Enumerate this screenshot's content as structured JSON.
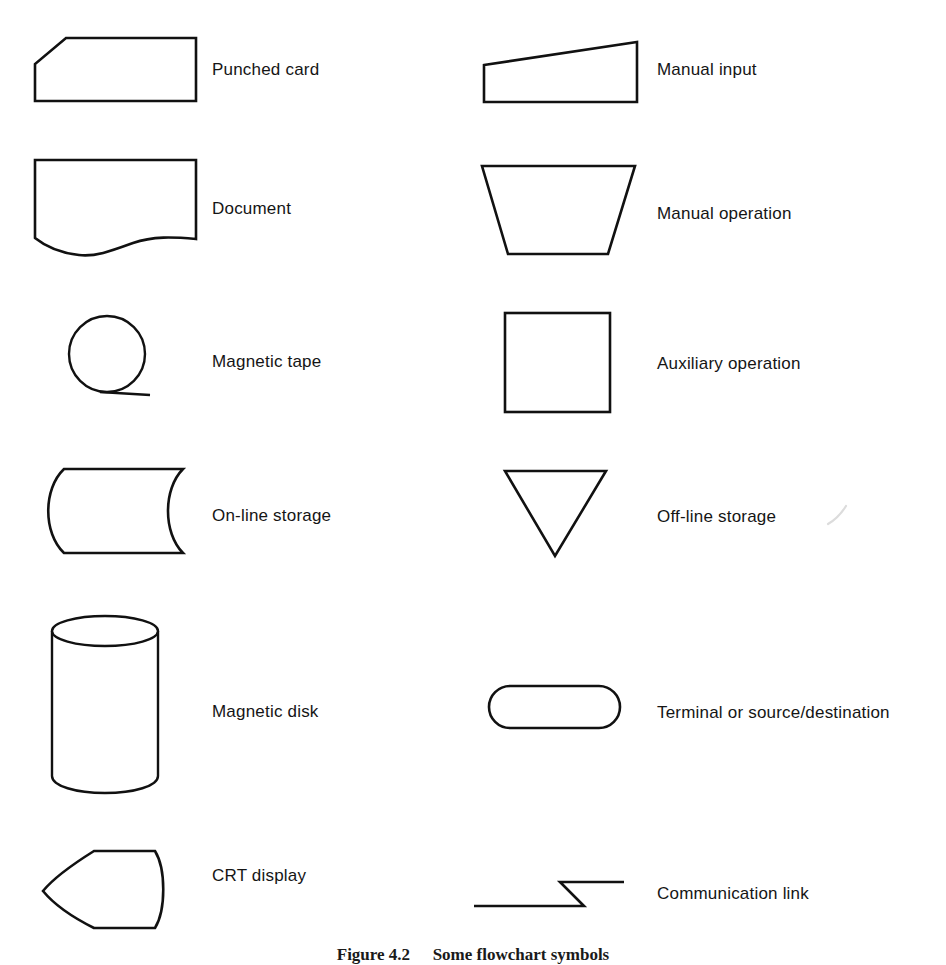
{
  "figure": {
    "caption_title": "Figure 4.2",
    "caption_rest": "Some flowchart symbols",
    "background_color": "#ffffff",
    "ink_color": "#111111"
  },
  "columns": {
    "left_label_x": 212,
    "right_label_x": 657
  },
  "symbols": [
    {
      "id": "punched-card",
      "label": "Punched card",
      "column": "left",
      "shape": "pentagon-cut-corner"
    },
    {
      "id": "manual-input",
      "label": "Manual input",
      "column": "right",
      "shape": "quadrilateral-slanted-top"
    },
    {
      "id": "document",
      "label": "Document",
      "column": "left",
      "shape": "rectangle-wavy-bottom"
    },
    {
      "id": "manual-operation",
      "label": "Manual operation",
      "column": "right",
      "shape": "inverted-trapezoid"
    },
    {
      "id": "magnetic-tape",
      "label": "Magnetic tape",
      "column": "left",
      "shape": "circle-with-tangent-line"
    },
    {
      "id": "auxiliary-operation",
      "label": "Auxiliary operation",
      "column": "right",
      "shape": "square"
    },
    {
      "id": "on-line-storage",
      "label": "On-line storage",
      "column": "left",
      "shape": "curved-side-cylinder-profile"
    },
    {
      "id": "off-line-storage",
      "label": "Off-line storage",
      "column": "right",
      "shape": "downward-triangle"
    },
    {
      "id": "magnetic-disk",
      "label": "Magnetic disk",
      "column": "left",
      "shape": "cylinder"
    },
    {
      "id": "terminal",
      "label": "Terminal or source/destination",
      "column": "right",
      "shape": "stadium"
    },
    {
      "id": "crt-display",
      "label": "CRT display",
      "column": "left",
      "shape": "pointed-left-rounded-right"
    },
    {
      "id": "communication-link",
      "label": "Communication link",
      "column": "right",
      "shape": "zigzag-line"
    }
  ]
}
